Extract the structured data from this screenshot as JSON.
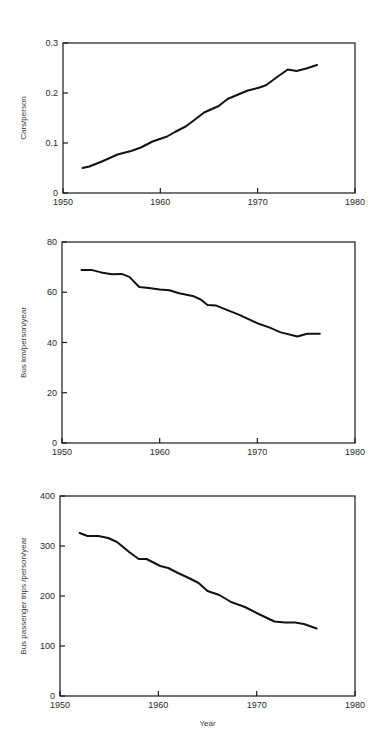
{
  "chart_data": [
    {
      "type": "line",
      "title": "",
      "xlabel": "",
      "ylabel": "Cars/person",
      "xlim": [
        1950,
        1980
      ],
      "ylim": [
        0,
        0.3
      ],
      "x_ticks": [
        1950,
        1960,
        1970,
        1980
      ],
      "x_tick_labels": [
        "1950",
        "1960",
        "1970",
        "1980"
      ],
      "y_ticks": [
        0,
        0.1,
        0.2,
        0.3
      ],
      "y_tick_labels": [
        "0",
        "0.1",
        "0.2",
        "0.3"
      ],
      "grid": false,
      "series": [
        {
          "name": "Cars per person",
          "x": [
            1952,
            1952.7,
            1954,
            1955.6,
            1957,
            1958,
            1959.2,
            1960.7,
            1961.5,
            1962.6,
            1963.5,
            1964.5,
            1966,
            1966.9,
            1968,
            1969,
            1970.2,
            1970.9,
            1972,
            1973.1,
            1974,
            1975,
            1976.1
          ],
          "y": [
            0.05,
            0.053,
            0.063,
            0.077,
            0.084,
            0.091,
            0.103,
            0.113,
            0.122,
            0.133,
            0.146,
            0.161,
            0.174,
            0.188,
            0.197,
            0.205,
            0.211,
            0.216,
            0.232,
            0.247,
            0.244,
            0.249,
            0.256
          ]
        }
      ]
    },
    {
      "type": "line",
      "title": "",
      "xlabel": "",
      "ylabel": "Bus km/person/year",
      "xlim": [
        1950,
        1980
      ],
      "ylim": [
        0,
        80
      ],
      "x_ticks": [
        1950,
        1960,
        1970,
        1980
      ],
      "x_tick_labels": [
        "1950",
        "1960",
        "1970",
        "1980"
      ],
      "y_ticks": [
        0,
        20,
        40,
        60,
        80
      ],
      "y_tick_labels": [
        "0",
        "20",
        "40",
        "60",
        "80"
      ],
      "grid": false,
      "series": [
        {
          "name": "Bus km per person per year",
          "x": [
            1952,
            1953,
            1954,
            1955.1,
            1956.1,
            1956.9,
            1957.9,
            1958.9,
            1960,
            1961,
            1962,
            1963.5,
            1964.2,
            1964.9,
            1965.8,
            1966.8,
            1968.1,
            1970,
            1971.2,
            1972.4,
            1974.1,
            1975.1,
            1976.4
          ],
          "y": [
            68.9,
            68.9,
            67.9,
            67.2,
            67.3,
            66.1,
            62.1,
            61.7,
            61.1,
            60.8,
            59.6,
            58.4,
            57.1,
            54.9,
            54.7,
            53.1,
            51.1,
            47.7,
            46.0,
            44.0,
            42.4,
            43.5,
            43.5
          ]
        }
      ]
    },
    {
      "type": "line",
      "title": "",
      "xlabel": "Year",
      "ylabel": "Bus passenger trips /person/year",
      "xlim": [
        1950,
        1980
      ],
      "ylim": [
        0,
        400
      ],
      "x_ticks": [
        1950,
        1960,
        1970,
        1980
      ],
      "x_tick_labels": [
        "1950",
        "1960",
        "1970",
        "1980"
      ],
      "y_ticks": [
        0,
        100,
        200,
        300,
        400
      ],
      "y_tick_labels": [
        "0",
        "100",
        "200",
        "300",
        "400"
      ],
      "grid": false,
      "series": [
        {
          "name": "Bus passenger trips per person per year",
          "x": [
            1952,
            1952.8,
            1953.9,
            1954.9,
            1955.8,
            1957.1,
            1958,
            1958.8,
            1960.2,
            1961,
            1962,
            1963.2,
            1964.1,
            1965,
            1966.2,
            1967.4,
            1968.8,
            1970.1,
            1971.8,
            1972.9,
            1973.9,
            1974.8,
            1976.1
          ],
          "y": [
            326,
            320,
            320,
            316,
            308,
            287,
            274,
            274,
            260,
            256,
            246,
            235,
            226,
            210,
            202,
            188,
            178,
            165,
            149,
            147,
            147,
            144,
            135
          ]
        }
      ]
    }
  ],
  "layout": {
    "panels": [
      {
        "left": 63,
        "right": 355,
        "top": 43,
        "bottom": 193
      },
      {
        "left": 62,
        "right": 355,
        "top": 242,
        "bottom": 443
      },
      {
        "left": 60,
        "right": 355,
        "top": 496,
        "bottom": 696
      }
    ]
  }
}
